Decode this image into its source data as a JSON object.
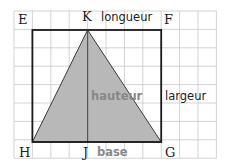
{
  "figure": {
    "grid": {
      "x0": 14,
      "y0": 11,
      "cols": 11,
      "rows": 8,
      "cell": 18.4,
      "color": "#c8c8c8"
    },
    "rectangle": {
      "color": "#1a1a1a",
      "fill": "#ffffff"
    },
    "triangle": {
      "fill": "#b8b8b8",
      "stroke": "#333333"
    },
    "points": {
      "E": "E",
      "F": "F",
      "G": "G",
      "H": "H",
      "J": "J",
      "K": "K"
    },
    "labels": {
      "longueur": "longueur",
      "largeur": "largeur",
      "hauteur": "hauteur",
      "base": "base"
    }
  }
}
